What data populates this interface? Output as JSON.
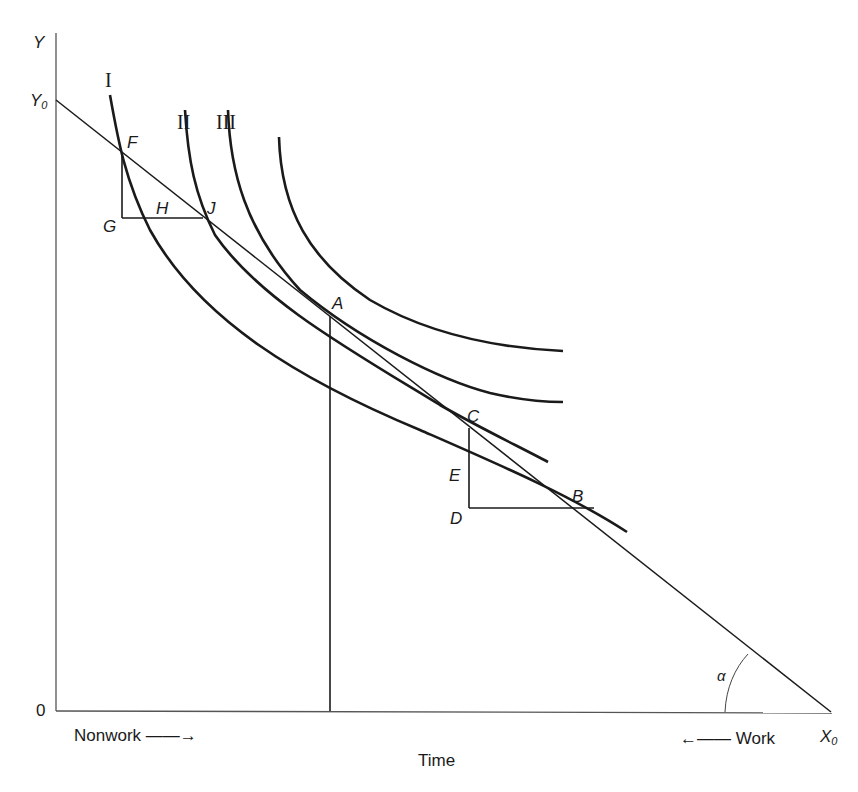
{
  "diagram": {
    "axes": {
      "y_label": "Y",
      "y_intercept_label": "Y",
      "y_intercept_sub": "0",
      "origin_label": "0",
      "x_intercept_label": "X",
      "x_intercept_sub": "0",
      "x_title": "Time",
      "left_direction_label": "Nonwork ——→",
      "right_direction_label": "←—— Work",
      "angle_label": "α"
    },
    "curves": [
      {
        "id": "I",
        "label": "I"
      },
      {
        "id": "II",
        "label": "II"
      },
      {
        "id": "III",
        "label": "III"
      },
      {
        "id": "IV",
        "label": ""
      }
    ],
    "points": {
      "F": "F",
      "G": "G",
      "H": "H",
      "J": "J",
      "A": "A",
      "C": "C",
      "E": "E",
      "D": "D",
      "B": "B"
    },
    "colors": {
      "ink": "#1a1a1a",
      "background": "#ffffff"
    }
  }
}
